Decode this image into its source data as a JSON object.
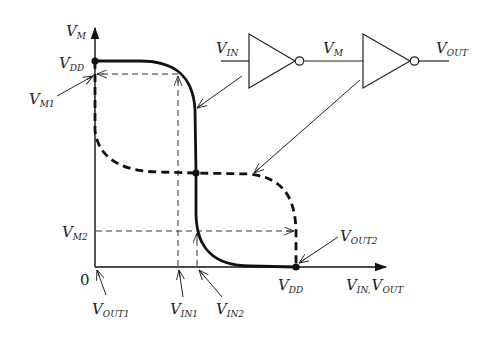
{
  "diagram": {
    "axes": {
      "y_label": {
        "main": "V",
        "sub": "M"
      },
      "x_label": {
        "main1": "V",
        "sub1": "IN,",
        "main2": "V",
        "sub2": "OUT"
      },
      "origin": "0"
    },
    "left_labels": {
      "vdd": {
        "main": "V",
        "sub": "DD"
      },
      "vm1": {
        "main": "V",
        "sub": "M1"
      },
      "vm2": {
        "main": "V",
        "sub": "M2"
      }
    },
    "bottom_labels": {
      "vout1": {
        "main": "V",
        "sub": "OUT1"
      },
      "vin1": {
        "main": "V",
        "sub": "IN1"
      },
      "vin2": {
        "main": "V",
        "sub": "IN2"
      },
      "vdd": {
        "main": "V",
        "sub": "DD"
      },
      "vout2": {
        "main": "V",
        "sub": "OUT2"
      }
    },
    "circuit": {
      "input": {
        "main": "V",
        "sub": "IN"
      },
      "middle": {
        "main": "V",
        "sub": "M"
      },
      "output": {
        "main": "V",
        "sub": "OUT"
      }
    },
    "curves": [
      {
        "name": "first-inverter-vtc",
        "style": "solid-thick",
        "relation": "V_M vs V_IN"
      },
      {
        "name": "second-inverter-vtc",
        "style": "dashed-thick",
        "relation": "V_M vs V_OUT (inverse)"
      }
    ],
    "colors": {
      "line": "#111111",
      "guide": "#333333",
      "text": "#222222"
    }
  }
}
